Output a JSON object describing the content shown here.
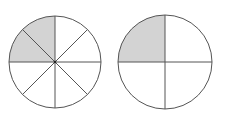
{
  "figure": {
    "colors": {
      "shade": "#d3d3d3",
      "stroke": "#555555",
      "background": "#ffffff"
    },
    "circles": [
      {
        "name": "eighths-circle",
        "parts": 8,
        "shaded": 2,
        "fraction": "2/8"
      },
      {
        "name": "quarters-circle",
        "parts": 4,
        "shaded": 1,
        "fraction": "1/4"
      }
    ]
  }
}
